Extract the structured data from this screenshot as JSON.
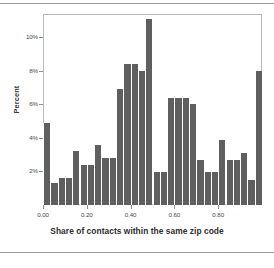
{
  "chart_data": {
    "type": "bar",
    "title": "",
    "subtitle": "",
    "xlabel": "Share of contacts within the same zip code",
    "ylabel": "Percent",
    "xlim": [
      0.0,
      1.0
    ],
    "ylim": [
      0.0,
      11.4
    ],
    "grid": false,
    "legend": null,
    "bar_color": "#5f5f5f",
    "frame_color": "#b9b9b9",
    "background": "#ffffff",
    "bin_width": 0.0333,
    "xtick_labels": [
      "0.00",
      "0.20",
      "0.40",
      "0.60",
      "0.80"
    ],
    "xtick_values": [
      0.0,
      0.2,
      0.4,
      0.6,
      0.8
    ],
    "ytick_labels": [
      "2%",
      "4%",
      "6%",
      "8%",
      "10%"
    ],
    "ytick_values": [
      2,
      4,
      6,
      8,
      10
    ],
    "categories": [
      "0.000",
      "0.033",
      "0.067",
      "0.100",
      "0.133",
      "0.167",
      "0.200",
      "0.233",
      "0.267",
      "0.300",
      "0.333",
      "0.367",
      "0.400",
      "0.433",
      "0.467",
      "0.500",
      "0.533",
      "0.567",
      "0.600",
      "0.633",
      "0.667",
      "0.700",
      "0.733",
      "0.767",
      "0.800",
      "0.833",
      "0.867",
      "0.900",
      "0.933",
      "0.967"
    ],
    "values": [
      4.9,
      1.3,
      1.6,
      1.6,
      3.2,
      2.4,
      2.4,
      3.6,
      2.8,
      2.8,
      6.9,
      8.4,
      8.4,
      8.0,
      11.1,
      2.0,
      2.0,
      6.4,
      6.4,
      6.4,
      6.0,
      2.7,
      2.0,
      2.0,
      3.9,
      2.7,
      2.7,
      3.1,
      1.5,
      8.0
    ]
  },
  "axes": {
    "y_title": "Percent",
    "x_title": "Share of contacts within the same zip code"
  }
}
